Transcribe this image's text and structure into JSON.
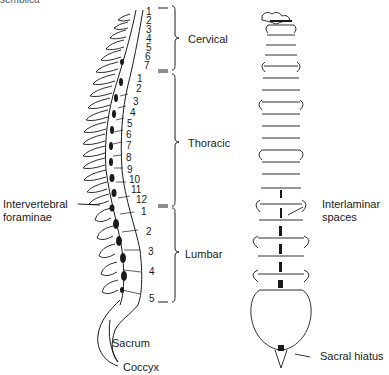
{
  "cropped_fragment": "semblica",
  "lateral_view": {
    "regions": [
      {
        "name": "Cervical",
        "vertebrae": [
          "1",
          "2",
          "3",
          "4",
          "5",
          "6",
          "7"
        ]
      },
      {
        "name": "Thoracic",
        "vertebrae": [
          "1",
          "2",
          "3",
          "4",
          "5",
          "6",
          "7",
          "8",
          "9",
          "10",
          "11",
          "12"
        ]
      },
      {
        "name": "Lumbar",
        "vertebrae": [
          "1",
          "2",
          "3",
          "4",
          "5"
        ]
      }
    ],
    "labels": {
      "intervertebral_line1": "Intervertebral",
      "intervertebral_line2": "foraminae",
      "sacrum": "Sacrum",
      "coccyx": "Coccyx"
    }
  },
  "posterior_view": {
    "labels": {
      "interlaminar_line1": "Interlaminar",
      "interlaminar_line2": "spaces",
      "sacral_hiatus": "Sacral hiatus"
    }
  },
  "colors": {
    "ink": "#1a1a1a",
    "background": "#ffffff"
  }
}
